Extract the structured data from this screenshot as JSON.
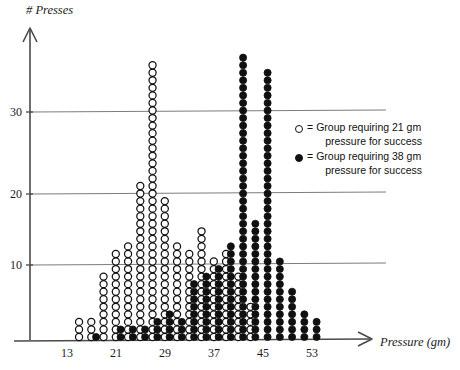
{
  "chart_data": {
    "type": "scatter",
    "title": "",
    "xlabel": "Pressure (gm)",
    "ylabel": "# Presses",
    "xlim": [
      9,
      60
    ],
    "ylim": [
      0,
      40
    ],
    "xticks": [
      13,
      21,
      29,
      37,
      45,
      53
    ],
    "yticks": [
      10,
      20,
      30
    ],
    "grid": "horizontal gridlines at 10, 20, 30",
    "legend_position": "right-middle",
    "plot_style": "stacked dot plot (each circle = 1 unit of # Presses)",
    "series": [
      {
        "name": "Group requiring 21 gm pressure for success",
        "marker": "open-circle",
        "color": "#ffffff",
        "edge_color": "#111111",
        "x": [
          15,
          17,
          19,
          21,
          23,
          25,
          27,
          29,
          31,
          33,
          35,
          37,
          39,
          41,
          43
        ],
        "values": [
          3,
          3,
          9,
          12,
          13,
          21,
          37,
          19,
          13,
          12,
          15,
          11,
          12,
          9,
          5
        ]
      },
      {
        "name": "Group requiring 38 gm pressure for success",
        "marker": "filled-circle",
        "color": "#101010",
        "edge_color": "#101010",
        "x": [
          17,
          21,
          23,
          25,
          27,
          29,
          31,
          33,
          35,
          37,
          39,
          41,
          43,
          45,
          47,
          49,
          51,
          53
        ],
        "values": [
          1,
          2,
          2,
          2,
          3,
          4,
          3,
          8,
          9,
          10,
          13,
          38,
          16,
          36,
          11,
          7,
          4,
          3
        ]
      }
    ]
  },
  "axes": {
    "y_title": "# Presses",
    "x_title": "Pressure (gm)",
    "y_tick_labels": [
      "30",
      "20",
      "10"
    ],
    "x_tick_labels": [
      "13",
      "21",
      "29",
      "37",
      "45",
      "53"
    ]
  },
  "legend": {
    "items": [
      {
        "symbol": "open-circle",
        "equals": "=",
        "line1": "Group requiring 21 gm",
        "line2": "pressure for success"
      },
      {
        "symbol": "filled-circle",
        "equals": "=",
        "line1": "Group requiring 38 gm",
        "line2": "pressure for success"
      }
    ]
  }
}
